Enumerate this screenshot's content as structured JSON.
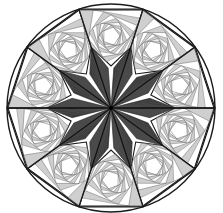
{
  "figure": {
    "center": [
      111,
      108
    ],
    "radius": 104,
    "symmetry_order": 10,
    "spiral_steps": 9,
    "colors": {
      "background": "#ffffff",
      "outline": "#1a1a1a",
      "spiral_line": "#555555",
      "spiral_fill": "#a8a8a8",
      "star_fill": "#3a3a3a",
      "star_line": "#222222"
    }
  }
}
